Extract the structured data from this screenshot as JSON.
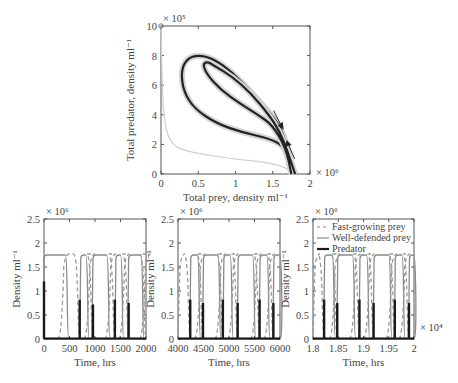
{
  "chart_data": [
    {
      "id": "phase",
      "type": "line",
      "title": "",
      "xlabel": "Total prey, density ml⁻¹",
      "ylabel": "Total predator, density ml⁻¹",
      "x_multiplier": "× 10⁶",
      "y_multiplier": "× 10⁵",
      "xlim": [
        0,
        2
      ],
      "ylim": [
        0,
        10
      ],
      "xticks": [
        "0",
        "0.5",
        "1",
        "1.5",
        "2"
      ],
      "yticks": [
        "0",
        "2",
        "4",
        "6",
        "8",
        "10"
      ],
      "series": [
        {
          "name": "transient",
          "color": "#cfcfcf",
          "points": [
            [
              0.0,
              10
            ],
            [
              0.02,
              5
            ],
            [
              0.06,
              3
            ],
            [
              0.15,
              2
            ],
            [
              0.3,
              1.6
            ],
            [
              0.6,
              1.3
            ],
            [
              1.0,
              1.0
            ],
            [
              1.4,
              0.8
            ],
            [
              1.65,
              0.5
            ],
            [
              1.75,
              0.1
            ]
          ]
        },
        {
          "name": "outer-cycle",
          "color": "#222222",
          "points": [
            [
              1.78,
              0
            ],
            [
              1.7,
              1.8
            ],
            [
              1.6,
              3.2
            ],
            [
              1.45,
              4.2
            ],
            [
              1.2,
              5.6
            ],
            [
              0.95,
              6.9
            ],
            [
              0.7,
              7.8
            ],
            [
              0.5,
              8.05
            ],
            [
              0.35,
              7.8
            ],
            [
              0.27,
              7.0
            ],
            [
              0.3,
              5.6
            ],
            [
              0.45,
              4.4
            ],
            [
              0.75,
              3.4
            ],
            [
              1.1,
              2.8
            ],
            [
              1.45,
              2.4
            ],
            [
              1.65,
              1.9
            ],
            [
              1.72,
              0.8
            ],
            [
              1.75,
              0
            ]
          ]
        },
        {
          "name": "inner-cycle",
          "color": "#222222",
          "points": [
            [
              1.75,
              0
            ],
            [
              1.68,
              1.7
            ],
            [
              1.5,
              3.3
            ],
            [
              1.3,
              4.0
            ],
            [
              1.05,
              4.8
            ],
            [
              0.8,
              5.7
            ],
            [
              0.62,
              6.7
            ],
            [
              0.56,
              7.4
            ],
            [
              0.62,
              7.6
            ],
            [
              0.72,
              7.3
            ],
            [
              0.95,
              6.6
            ],
            [
              1.2,
              5.5
            ],
            [
              1.45,
              4.0
            ],
            [
              1.6,
              2.8
            ],
            [
              1.7,
              1.5
            ],
            [
              1.8,
              0
            ]
          ]
        }
      ],
      "annotations": [
        {
          "type": "arrow",
          "direction": "down-right",
          "at": [
            1.62,
            3.2
          ]
        },
        {
          "type": "arrow",
          "direction": "up-left",
          "at": [
            1.7,
            2.1
          ]
        },
        {
          "type": "marker",
          "shape": "circle",
          "at": [
            0,
            10
          ]
        }
      ]
    },
    {
      "id": "ts1",
      "type": "line",
      "xlabel": "Time, hrs",
      "ylabel": "Density ml⁻¹",
      "y_multiplier": "× 10⁶",
      "xlim": [
        0,
        2000
      ],
      "ylim": [
        0,
        2.5
      ],
      "xticks": [
        "0",
        "500",
        "1000",
        "1500",
        "2000"
      ],
      "yticks": [
        "0",
        "0.5",
        "1",
        "1.5",
        "2",
        "2.5"
      ],
      "predator_spikes": [
        {
          "t": 0,
          "h": 1.2
        },
        {
          "t": 700,
          "h": 0.82
        },
        {
          "t": 960,
          "h": 0.72
        },
        {
          "t": 1390,
          "h": 0.82
        },
        {
          "t": 1660,
          "h": 0.75
        }
      ],
      "well_defended_plateaus": [
        [
          0,
          420
        ],
        [
          720,
          820
        ],
        [
          960,
          1230
        ],
        [
          1410,
          1500
        ],
        [
          1660,
          1900
        ]
      ],
      "fast_growing_peaks": [
        [
          350,
          700
        ],
        [
          860,
          960
        ],
        [
          1270,
          1390
        ],
        [
          1540,
          1660
        ],
        [
          1950,
          2000
        ]
      ],
      "plateau_level": 1.75
    },
    {
      "id": "ts2",
      "type": "line",
      "xlabel": "Time, hrs",
      "ylabel": "Density ml⁻¹",
      "y_multiplier": "× 10⁶",
      "xlim": [
        4000,
        6000
      ],
      "ylim": [
        0,
        2.5
      ],
      "xticks": [
        "4000",
        "4500",
        "5000",
        "5500",
        "6000"
      ],
      "yticks": [
        "0",
        "0.5",
        "1",
        "1.5",
        "2",
        "2.5"
      ],
      "predator_spikes": [
        {
          "t": 4240,
          "h": 0.82
        },
        {
          "t": 4490,
          "h": 0.75
        },
        {
          "t": 4880,
          "h": 0.82
        },
        {
          "t": 5170,
          "h": 0.75
        },
        {
          "t": 5600,
          "h": 0.82
        },
        {
          "t": 5870,
          "h": 0.75
        }
      ],
      "well_defended_plateaus": [
        [
          4250,
          4380
        ],
        [
          4500,
          4780
        ],
        [
          4900,
          5020
        ],
        [
          5180,
          5460
        ],
        [
          5610,
          5740
        ],
        [
          5880,
          6000
        ]
      ],
      "fast_growing_peaks": [
        [
          4000,
          4240
        ],
        [
          4400,
          4490
        ],
        [
          4800,
          4880
        ],
        [
          5050,
          5170
        ],
        [
          5500,
          5600
        ],
        [
          5760,
          5870
        ]
      ],
      "plateau_level": 1.75
    },
    {
      "id": "ts3",
      "type": "line",
      "xlabel": "Time, hrs",
      "ylabel": "Density ml⁻¹",
      "x_multiplier": "× 10⁴",
      "y_multiplier": "× 10⁶",
      "xlim": [
        1.8,
        2.0
      ],
      "ylim": [
        0,
        2.5
      ],
      "xticks": [
        "1.8",
        "1.85",
        "1.9",
        "1.95",
        "2"
      ],
      "yticks": [
        "0",
        "0.5",
        "1",
        "1.5",
        "2",
        "2.5"
      ],
      "legend": [
        {
          "label": "Fast-growing prey",
          "style": "dashed",
          "color": "#8a8a8a"
        },
        {
          "label": "Well-defended prey",
          "style": "solid",
          "color": "#8a8a8a"
        },
        {
          "label": "Predator",
          "style": "solid-thick",
          "color": "#1a1a1a"
        }
      ],
      "predator_spikes": [
        {
          "t": 1.822,
          "h": 0.82
        },
        {
          "t": 1.848,
          "h": 0.75
        },
        {
          "t": 1.892,
          "h": 0.82
        },
        {
          "t": 1.92,
          "h": 0.75
        },
        {
          "t": 1.962,
          "h": 0.82
        },
        {
          "t": 1.99,
          "h": 0.75
        }
      ],
      "well_defended_plateaus": [
        [
          1.823,
          1.838
        ],
        [
          1.849,
          1.878
        ],
        [
          1.893,
          1.906
        ],
        [
          1.921,
          1.95
        ],
        [
          1.963,
          1.976
        ],
        [
          1.991,
          2.0
        ]
      ],
      "fast_growing_peaks": [
        [
          1.8,
          1.822
        ],
        [
          1.84,
          1.848
        ],
        [
          1.88,
          1.892
        ],
        [
          1.908,
          1.92
        ],
        [
          1.952,
          1.962
        ],
        [
          1.978,
          1.99
        ]
      ],
      "plateau_level": 1.75
    }
  ]
}
